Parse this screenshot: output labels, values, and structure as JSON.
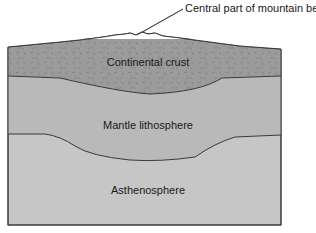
{
  "diagram": {
    "callout": "Central part of mountain belt",
    "layers": [
      {
        "name": "Continental crust",
        "color": "#9b9b9b"
      },
      {
        "name": "Mantle lithosphere",
        "color": "#b9b9b9"
      },
      {
        "name": "Asthenosphere",
        "color": "#c6c6c6"
      }
    ],
    "line_color": "#3a3a3a"
  }
}
